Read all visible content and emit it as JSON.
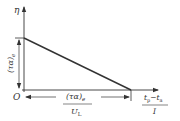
{
  "diagram": {
    "type": "line-graph",
    "y_axis_label": "η",
    "origin_label": "O",
    "intercept_label": "(τα)",
    "intercept_subscript": "e",
    "x_dimension_numerator": "(τα)",
    "x_dimension_numerator_subscript": "e",
    "x_dimension_denominator": "U",
    "x_dimension_denominator_subscript": "L",
    "x_axis_label_numerator_t1": "t",
    "x_axis_label_numerator_t1_sub": "p",
    "x_axis_label_minus": "−",
    "x_axis_label_numerator_t2": "t",
    "x_axis_label_numerator_t2_sub": "a",
    "x_axis_label_denominator": "I",
    "line_color": "#333333"
  }
}
